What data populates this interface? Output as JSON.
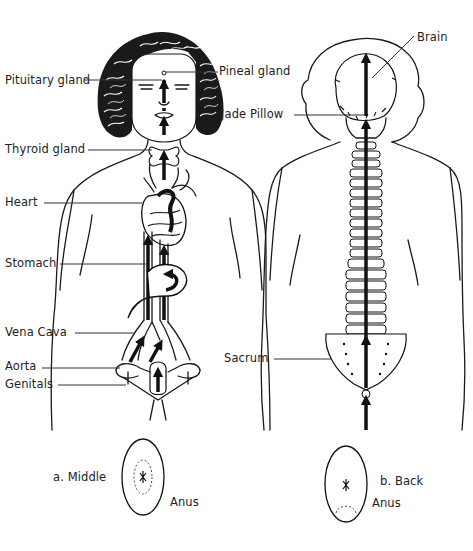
{
  "figure": {
    "front_labels": [
      {
        "id": "pituitary",
        "text": "Pituitary gland"
      },
      {
        "id": "pineal",
        "text": "Pineal gland"
      },
      {
        "id": "thyroid",
        "text": "Thyroid gland"
      },
      {
        "id": "heart",
        "text": "Heart"
      },
      {
        "id": "stomach",
        "text": "Stomach"
      },
      {
        "id": "vena_cava",
        "text": "Vena Cava"
      },
      {
        "id": "aorta",
        "text": "Aorta"
      },
      {
        "id": "genitals",
        "text": "Genitals"
      }
    ],
    "back_labels": [
      {
        "id": "brain",
        "text": "Brain"
      },
      {
        "id": "jade_pillow",
        "text": "Jade Pillow"
      },
      {
        "id": "sacrum",
        "text": "Sacrum"
      }
    ],
    "insets": [
      {
        "id": "a",
        "caption": "a. Middle",
        "anus_label": "Anus"
      },
      {
        "id": "b",
        "caption": "b. Back",
        "anus_label": "Anus"
      }
    ]
  },
  "colors": {
    "ink": "#1a1a1a",
    "background": "#ffffff",
    "label_text": "#222222"
  }
}
